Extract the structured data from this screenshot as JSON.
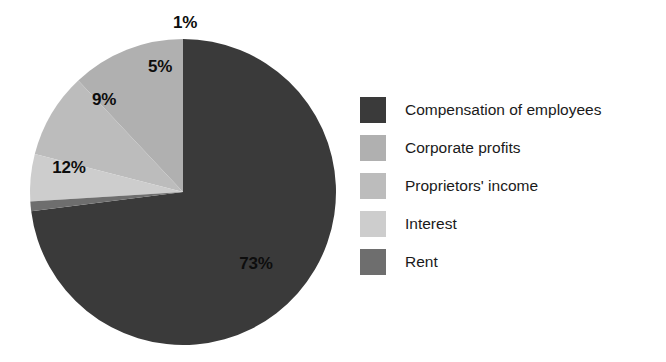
{
  "chart_data": {
    "type": "pie",
    "title": "",
    "subtitle": "",
    "labels": [
      "Compensation of employees",
      "Corporate profits",
      "Proprietors' income",
      "Interest",
      "Rent"
    ],
    "values": [
      73,
      12,
      9,
      5,
      1
    ],
    "value_labels": [
      "73%",
      "12%",
      "9%",
      "5%",
      "1%"
    ],
    "value_unit": "%",
    "colors": [
      "#3a3a3a",
      "#b0b0b0",
      "#bcbcbc",
      "#cdcdcd",
      "#6e6e6e"
    ],
    "legend_position": "right",
    "grid": false,
    "start_angle_deg": 0,
    "direction": "clockwise",
    "slices": [
      {
        "label": "Compensation of employees",
        "value": 73,
        "display": "73%",
        "color": "#3a3a3a"
      },
      {
        "label": "Corporate profits",
        "value": 12,
        "display": "12%",
        "color": "#b0b0b0"
      },
      {
        "label": "Proprietors' income",
        "value": 9,
        "display": "9%",
        "color": "#bcbcbc"
      },
      {
        "label": "Interest",
        "value": 5,
        "display": "5%",
        "color": "#cdcdcd"
      },
      {
        "label": "Rent",
        "value": 1,
        "display": "1%",
        "color": "#6e6e6e"
      }
    ]
  },
  "legend": {
    "items": [
      {
        "label": "Compensation of employees",
        "color": "#3a3a3a"
      },
      {
        "label": "Corporate profits",
        "color": "#b0b0b0"
      },
      {
        "label": "Proprietors' income",
        "color": "#bcbcbc"
      },
      {
        "label": "Interest",
        "color": "#cdcdcd"
      },
      {
        "label": "Rent",
        "color": "#6e6e6e"
      }
    ]
  },
  "pie_labels": {
    "compensation": "73%",
    "corporate": "12%",
    "proprietors": "9%",
    "interest": "5%",
    "rent": "1%"
  }
}
